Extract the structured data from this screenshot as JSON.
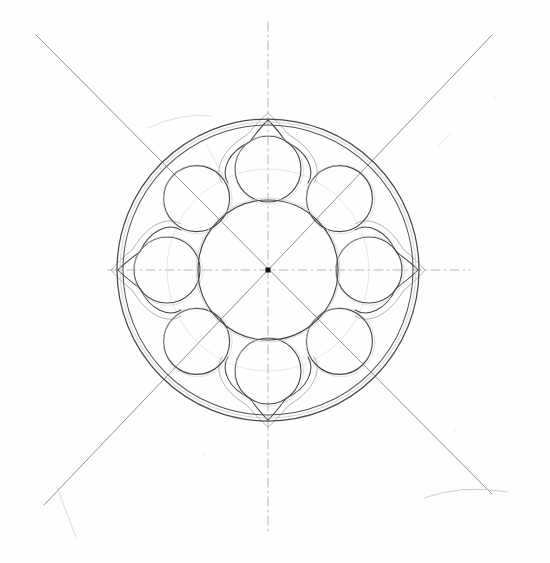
{
  "document": {
    "title": "Rose Window Tracery Construction Drawing",
    "medium": "pencil on paper",
    "canvas": {
      "width": 550,
      "height": 563
    },
    "background_color": "#fefefe"
  },
  "drawing": {
    "type": "geometric-construction",
    "subject": "gothic rose window / octofoil rosette tracery",
    "center": {
      "x": 268,
      "y": 270
    },
    "center_marker": {
      "name": "center-point",
      "shape": "square",
      "size": 5,
      "color": "#111111"
    },
    "ink": {
      "primary": "#3b3b3f",
      "secondary": "#6e6e74",
      "faint": "#a9a9b0",
      "construction": "#b8b8bd",
      "ghost": "#d2d2d6"
    },
    "circles": [
      {
        "name": "outer-circle",
        "cx": 268,
        "cy": 270,
        "r": 151,
        "stroke": "#4a4a4e",
        "width": 1.25
      },
      {
        "name": "outer-circle-inner",
        "cx": 268,
        "cy": 270,
        "r": 145,
        "stroke": "#55555a",
        "width": 1.05
      },
      {
        "name": "outer-circle-ghost",
        "cx": 268,
        "cy": 270,
        "r": 148,
        "stroke": "#c9c9ce",
        "width": 0.8
      },
      {
        "name": "central-circle",
        "cx": 268,
        "cy": 270,
        "r": 70,
        "stroke": "#4a4a4e",
        "width": 1.15
      },
      {
        "name": "central-circle-ghost",
        "cx": 268,
        "cy": 270,
        "r": 72,
        "stroke": "#cfcfd4",
        "width": 0.7
      },
      {
        "name": "lobe-pitch-circle",
        "cx": 268,
        "cy": 270,
        "r": 101,
        "stroke": "#d6d6da",
        "width": 0.6
      }
    ],
    "lobes": {
      "name": "lobe-circles",
      "count": 8,
      "orbit_radius": 101,
      "lobe_radius": 33,
      "start_angle_deg": -90,
      "step_deg": 45,
      "stroke": "#45454a",
      "width": 1.1
    },
    "ogees": {
      "name": "ogee-arches",
      "count": 4,
      "angles_deg": [
        -90,
        0,
        90,
        180
      ],
      "tip_radius": 150,
      "shoulder_radius": 101,
      "half_width": 40,
      "stroke": "#44444a",
      "width": 1.05,
      "echo_stroke": "#9c9ca3",
      "echo_width": 0.8,
      "echo_offset": 7
    },
    "axes": [
      {
        "name": "horizontal-axis",
        "x1": 108,
        "y1": 270,
        "x2": 470,
        "y2": 270,
        "dash": "9 4 2 4",
        "stroke": "#b0b0b6"
      },
      {
        "name": "vertical-axis",
        "x1": 268,
        "y1": 22,
        "x2": 268,
        "y2": 533,
        "dash": "9 4 2 4",
        "stroke": "#b0b0b6"
      }
    ],
    "diagonals": [
      {
        "name": "diagonal-nw-se",
        "x1": 36,
        "y1": 35,
        "x2": 492,
        "y2": 494,
        "stroke": "#7b7b82",
        "width": 0.85
      },
      {
        "name": "diagonal-ne-sw",
        "x1": 492,
        "y1": 35,
        "x2": 44,
        "y2": 505,
        "stroke": "#7b7b82",
        "width": 0.85
      }
    ],
    "stray_marks": [
      {
        "name": "stray-arc-top-right",
        "d": "M 148 128 Q 182 112 212 116",
        "stroke": "#d8d8dc",
        "width": 0.8
      },
      {
        "name": "stray-arc-bottom-right",
        "d": "M 424 498 Q 462 484 508 492",
        "stroke": "#c8c8cd",
        "width": 0.9
      },
      {
        "name": "stray-line-bottom-left",
        "d": "M 57 487 Q 66 512 76 537",
        "stroke": "#d4d4d8",
        "width": 0.8
      },
      {
        "name": "stray-tick-top-right",
        "d": "M 438 146 L 452 133",
        "stroke": "#dadade",
        "width": 0.7
      },
      {
        "name": "stray-smudge-left",
        "d": "M 206 144 Q 216 162 226 182",
        "stroke": "#dedee2",
        "width": 0.8
      }
    ],
    "speck_count": 5
  }
}
